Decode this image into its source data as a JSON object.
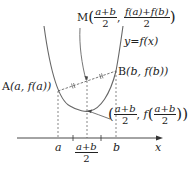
{
  "diagram": {
    "function_label": "y=f(x)",
    "point_A": {
      "name": "A",
      "coords": "(a, f(a))"
    },
    "point_B": {
      "name": "B",
      "coords": "(b, f(b))"
    },
    "point_M": {
      "name": "M",
      "x_num": "a+b",
      "x_den": "2",
      "y_num": "f(a)+f(b)",
      "y_den": "2"
    },
    "point_curve_mid": {
      "x_num": "a+b",
      "x_den": "2",
      "f_prefix": "f",
      "y_num": "a+b",
      "y_den": "2"
    },
    "x_axis": {
      "label": "x",
      "ticks": [
        "a",
        "b"
      ],
      "mid_tick_num": "a+b",
      "mid_tick_den": "2"
    },
    "colors": {
      "curve": "#666666",
      "axis": "#333333",
      "dashed": "#555555",
      "text": "#222222"
    }
  }
}
